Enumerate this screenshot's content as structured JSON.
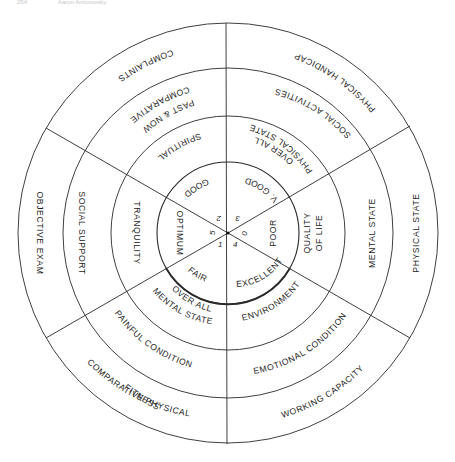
{
  "header": {
    "page_number": "254",
    "running_title": "Aaron Antonovsky"
  },
  "diagram": {
    "center": {
      "x": 228,
      "y": 233
    },
    "ring_radii": [
      71,
      117,
      165,
      210
    ],
    "sector_numbers": {
      "top_right": "3",
      "right": "0",
      "bottom_right": "4",
      "bottom_left": "1",
      "left": "5",
      "top_left": "2"
    },
    "inner_ring": {
      "top_right": "V. GOOD",
      "right": "POOR",
      "bottom_right": "EXCELLENT",
      "bottom_left": "FAIR",
      "left": "OPTIMUM",
      "top_left": "GOOD"
    },
    "second_ring": {
      "top_right_line1": "OVER ALL",
      "top_right_line2": "PHYSICAL STATE",
      "right_line1": "QUALITY",
      "right_line2": "OF LIFE",
      "bottom_right": "ENVIRONMENT",
      "bottom_left_line1": "OVER ALL",
      "bottom_left_line2": "MENTAL STATE",
      "left": "TRANQUILITY",
      "top_left": "SPIRITUAL"
    },
    "third_ring": {
      "top_right": "SOCIAL ACTIVITIES",
      "right": "MENTAL STATE",
      "bottom_right": "EMOTIONAL CONDITION",
      "bottom_left": "PAINFUL CONDITION",
      "left": "SOCIAL SUPPORT",
      "top_left_line1": "COMPARATIVE",
      "top_left_line2": "PAST & NOW"
    },
    "outer_ring": {
      "top_right": "PHYSICAL HANDICAP",
      "right": "PHYSICAL STATE",
      "bottom_right": "WORKING CAPACITY",
      "bottom_left_line1": "COMPARATIVE PHYSICAL",
      "bottom_left_line2": "FITNESS",
      "left": "OBJECTIVE EXAM",
      "top_left": "COMPLAINTS"
    }
  }
}
